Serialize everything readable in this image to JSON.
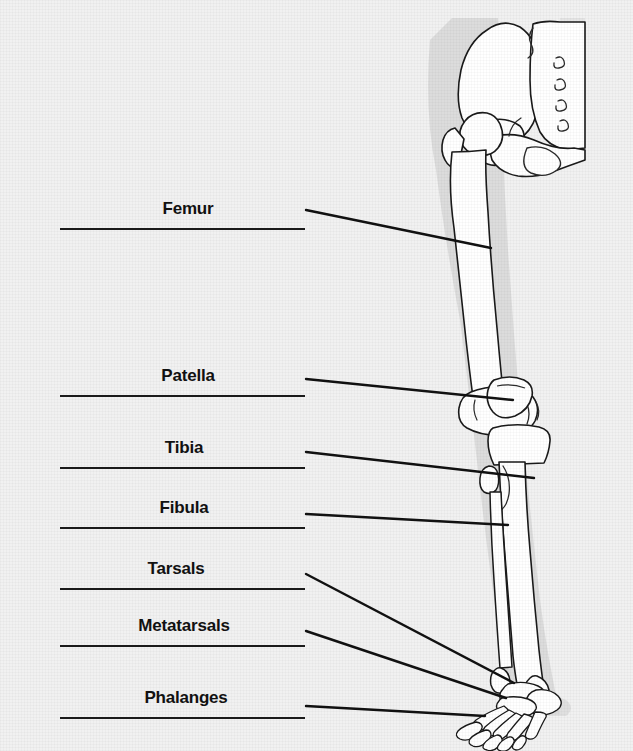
{
  "figure": {
    "background_color": "#f1f1f1",
    "ink_color": "#1a1a1a",
    "bone_fill_color": "#ffffff",
    "shadow_color": "#d9d9d9"
  },
  "illustration": {
    "name": "lower-limb-skeleton",
    "parts": [
      "pelvis",
      "sacrum",
      "hip-joint",
      "femur",
      "patella",
      "tibia",
      "fibula",
      "tarsals",
      "metatarsals",
      "phalanges"
    ]
  },
  "labels": [
    {
      "id": "femur",
      "text": "Femur",
      "text_x": 188,
      "text_y": 199,
      "rule_x": 60,
      "rule_y": 228,
      "rule_width": 245,
      "leader": {
        "x1": 306,
        "y1": 210,
        "x2": 491,
        "y2": 248
      }
    },
    {
      "id": "patella",
      "text": "Patella",
      "text_x": 188,
      "text_y": 366,
      "rule_x": 60,
      "rule_y": 395,
      "rule_width": 245,
      "leader": {
        "x1": 306,
        "y1": 379,
        "x2": 513,
        "y2": 400
      }
    },
    {
      "id": "tibia",
      "text": "Tibia",
      "text_x": 184,
      "text_y": 438,
      "rule_x": 60,
      "rule_y": 467,
      "rule_width": 245,
      "leader": {
        "x1": 306,
        "y1": 452,
        "x2": 534,
        "y2": 478
      }
    },
    {
      "id": "fibula",
      "text": "Fibula",
      "text_x": 184,
      "text_y": 498,
      "rule_x": 60,
      "rule_y": 527,
      "rule_width": 245,
      "leader": {
        "x1": 306,
        "y1": 514,
        "x2": 508,
        "y2": 525
      }
    },
    {
      "id": "tarsals",
      "text": "Tarsals",
      "text_x": 176,
      "text_y": 559,
      "rule_x": 60,
      "rule_y": 588,
      "rule_width": 245,
      "leader": {
        "x1": 306,
        "y1": 574,
        "x2": 514,
        "y2": 683
      }
    },
    {
      "id": "metatarsals",
      "text": "Metatarsals",
      "text_x": 184,
      "text_y": 616,
      "rule_x": 60,
      "rule_y": 645,
      "rule_width": 245,
      "leader": {
        "x1": 306,
        "y1": 631,
        "x2": 506,
        "y2": 698
      }
    },
    {
      "id": "phalanges",
      "text": "Phalanges",
      "text_x": 186,
      "text_y": 688,
      "rule_x": 60,
      "rule_y": 717,
      "rule_width": 245,
      "leader": {
        "x1": 306,
        "y1": 706,
        "x2": 485,
        "y2": 716
      }
    }
  ]
}
